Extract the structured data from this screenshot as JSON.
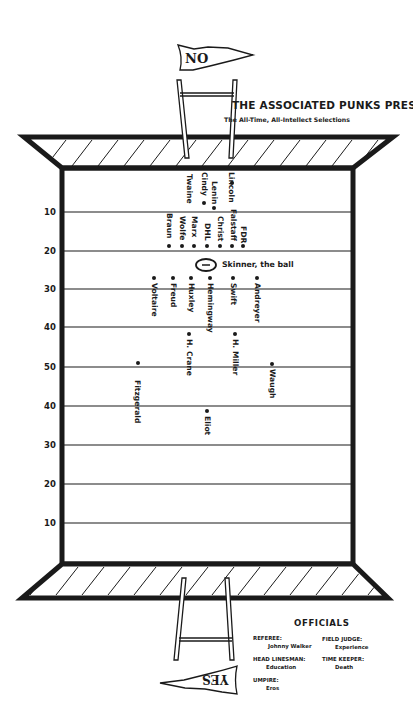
{
  "header": {
    "title": "THE ASSOCIATED PUNKS PRESENT",
    "subtitle": "The All-Time, All-Intellect Selections"
  },
  "pennants": {
    "top": "NO",
    "bottom": "YES"
  },
  "field": {
    "yard_labels": [
      "10",
      "20",
      "30",
      "40",
      "50",
      "40",
      "30",
      "20",
      "10"
    ],
    "ball_label": "Skinner, the ball",
    "players": [
      {
        "name": "Lincoln",
        "x": 232,
        "y": 176,
        "dot": "top"
      },
      {
        "name": "Cindy",
        "x": 204,
        "y": 176,
        "dot": "bottom"
      },
      {
        "name": "Twaine",
        "x": 189,
        "y": 176,
        "dot": "none"
      },
      {
        "name": "Lenin",
        "x": 214,
        "y": 180,
        "dot": "bottom"
      },
      {
        "name": "Falstaff",
        "x": 232,
        "y": 212,
        "dot": "bottom"
      },
      {
        "name": "FDR",
        "x": 243,
        "y": 224,
        "dot": "bottom"
      },
      {
        "name": "Christ",
        "x": 219,
        "y": 218,
        "dot": "bottom"
      },
      {
        "name": "DHL",
        "x": 206,
        "y": 224,
        "dot": "bottom"
      },
      {
        "name": "Marx",
        "x": 193,
        "y": 218,
        "dot": "bottom"
      },
      {
        "name": "Wolfe",
        "x": 181,
        "y": 218,
        "dot": "bottom"
      },
      {
        "name": "Braun",
        "x": 168,
        "y": 214,
        "dot": "bottom"
      },
      {
        "name": "Voltaire",
        "x": 155,
        "y": 276,
        "dot": "top"
      },
      {
        "name": "Freud",
        "x": 174,
        "y": 276,
        "dot": "top"
      },
      {
        "name": "Huxley",
        "x": 191,
        "y": 276,
        "dot": "top"
      },
      {
        "name": "Hemingway",
        "x": 210,
        "y": 276,
        "dot": "top"
      },
      {
        "name": "Swift",
        "x": 232,
        "y": 276,
        "dot": "top"
      },
      {
        "name": "Andreyer",
        "x": 256,
        "y": 276,
        "dot": "top"
      },
      {
        "name": "H. Crane",
        "x": 188,
        "y": 334,
        "dot": "top"
      },
      {
        "name": "H. Miller",
        "x": 234,
        "y": 334,
        "dot": "top"
      },
      {
        "name": "Fitzgerald",
        "x": 136,
        "y": 362,
        "dot": "top"
      },
      {
        "name": "Waugh",
        "x": 270,
        "y": 364,
        "dot": "top"
      },
      {
        "name": "Eliot",
        "x": 205,
        "y": 408,
        "dot": "top"
      }
    ]
  },
  "officials": {
    "title": "OFFICIALS",
    "left": [
      {
        "role": "REFEREE:",
        "name": "Johnny Walker"
      },
      {
        "role": "HEAD LINESMAN:",
        "name": "Education"
      },
      {
        "role": "UMPIRE:",
        "name": "Eros"
      }
    ],
    "right": [
      {
        "role": "FIELD JUDGE:",
        "name": "Experience"
      },
      {
        "role": "TIME KEEPER:",
        "name": "Death"
      }
    ]
  },
  "colors": {
    "ink": "#1a1a1a",
    "paper": "#ffffff"
  }
}
